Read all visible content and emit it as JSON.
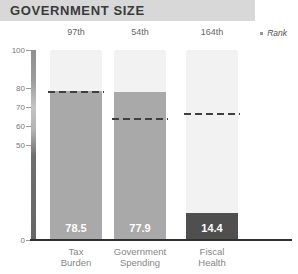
{
  "header": {
    "title": "GOVERNMENT SIZE"
  },
  "rank_legend": {
    "label": "Rank"
  },
  "colors": {
    "header_band": "#d8d8d8",
    "title_text": "#3a3a3a",
    "bar_gray": "#a9a9a9",
    "bar_dark": "#4f4f4f",
    "track": "#f2f2f2",
    "value_text": "#ffffff",
    "avg_dash": "#3f3f3f"
  },
  "chart_data": {
    "type": "bar",
    "title": "GOVERNMENT SIZE",
    "categories": [
      "Tax Burden",
      "Government Spending",
      "Fiscal Health"
    ],
    "values": [
      78.5,
      77.9,
      14.4
    ],
    "ranks": [
      "97th",
      "54th",
      "164th"
    ],
    "world_averages": [
      78.0,
      63.6,
      66.2
    ],
    "bar_colors": [
      "#a9a9a9",
      "#a9a9a9",
      "#4f4f4f"
    ],
    "value_labels": [
      "78.5",
      "77.9",
      "14.4"
    ],
    "xlabel": "",
    "ylabel": "",
    "ylim": [
      0,
      100
    ],
    "yticks": [
      100,
      80,
      70,
      60,
      50,
      0
    ],
    "grid": false,
    "avg_line_style": "dashed",
    "rank_legend_position": "top-right"
  }
}
